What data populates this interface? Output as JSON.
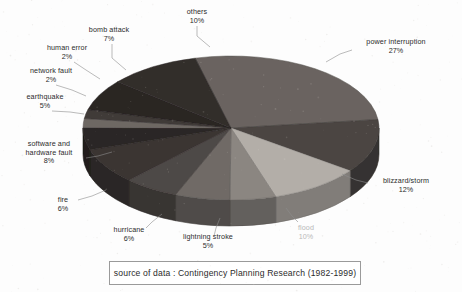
{
  "chart_data": {
    "type": "pie",
    "title": "",
    "subtitle": "",
    "xlabel": "",
    "ylabel": "",
    "legend_position": "none",
    "grid": false,
    "style": "3d-exploded-pie",
    "units": "percent",
    "labels_format": "name + percent",
    "categories": [
      "power interruption",
      "blizzard/storm",
      "flood",
      "lightning stroke",
      "hurricane",
      "fire",
      "software and hardware fault",
      "earthquake",
      "network fault",
      "human error",
      "bomb attack",
      "others"
    ],
    "values": [
      27,
      12,
      10,
      5,
      6,
      6,
      8,
      5,
      2,
      2,
      7,
      10
    ],
    "colors": [
      "#6a6460",
      "#4b4542",
      "#b3aea8",
      "#8b8681",
      "#6f6a66",
      "#4e4846",
      "#3b3533",
      "#2c2725",
      "#6e6864",
      "#413b39",
      "#2a2523",
      "#332e2c"
    ],
    "total": 100,
    "slices": [
      {
        "label": "power interruption",
        "value": 27,
        "display": "27%",
        "color": "#6a6460"
      },
      {
        "label": "blizzard/storm",
        "value": 12,
        "display": "12%",
        "color": "#4b4542"
      },
      {
        "label": "flood",
        "value": 10,
        "display": "10%",
        "color": "#b3aea8"
      },
      {
        "label": "lightning stroke",
        "value": 5,
        "display": "5%",
        "color": "#8b8681"
      },
      {
        "label": "hurricane",
        "value": 6,
        "display": "6%",
        "color": "#6f6a66"
      },
      {
        "label": "fire",
        "value": 6,
        "display": "6%",
        "color": "#4e4846"
      },
      {
        "label": "software and hardware fault",
        "value": 8,
        "display": "8%",
        "color": "#3b3533"
      },
      {
        "label": "earthquake",
        "value": 5,
        "display": "5%",
        "color": "#2c2725"
      },
      {
        "label": "network fault",
        "value": 2,
        "display": "2%",
        "color": "#6e6864"
      },
      {
        "label": "human error",
        "value": 2,
        "display": "2%",
        "color": "#413b39"
      },
      {
        "label": "bomb attack",
        "value": 7,
        "display": "7%",
        "color": "#2a2523"
      },
      {
        "label": "others",
        "value": 10,
        "display": "10%",
        "color": "#332e2c"
      }
    ]
  },
  "labels": {
    "power_interruption": {
      "name": "power interruption",
      "pct": "27%"
    },
    "blizzard_storm": {
      "name": "blizzard/storm",
      "pct": "12%"
    },
    "flood": {
      "name": "flood",
      "pct": "10%"
    },
    "lightning_stroke": {
      "name": "lightning stroke",
      "pct": "5%"
    },
    "hurricane": {
      "name": "hurricane",
      "pct": "6%"
    },
    "fire": {
      "name": "fire",
      "pct": "6%"
    },
    "software_hardware_fault": {
      "name_line1": "software and",
      "name_line2": "hardware fault",
      "pct": "8%"
    },
    "earthquake": {
      "name": "earthquake",
      "pct": "5%"
    },
    "network_fault": {
      "name": "network fault",
      "pct": "2%"
    },
    "human_error": {
      "name": "human error",
      "pct": "2%"
    },
    "bomb_attack": {
      "name": "bomb attack",
      "pct": "7%"
    },
    "others": {
      "name": "others",
      "pct": "10%"
    }
  },
  "caption": {
    "text": "source of data  :  Contingency Planning Research (1982-1999)"
  }
}
